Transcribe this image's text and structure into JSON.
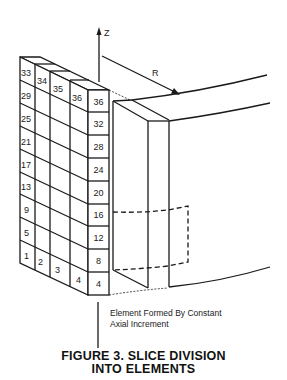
{
  "figure": {
    "caption_line1": "FIGURE 3.   SLICE DIVISION",
    "caption_line2": "INTO ELEMENTS",
    "axis_label": "Z",
    "radius_label": "R",
    "annotation_line1": "Element Formed By Constant",
    "annotation_line2": "Axial Increment"
  },
  "grid": {
    "front_column_labels": [
      "36",
      "32",
      "28",
      "24",
      "20",
      "16",
      "12",
      "8",
      "4"
    ],
    "left_column_labels": [
      "33",
      "29",
      "25",
      "21",
      "17",
      "13",
      "9",
      "5",
      "1"
    ],
    "top_row_labels": [
      "33",
      "34",
      "35",
      "36"
    ],
    "bottom_row_labels": [
      "1",
      "2",
      "3",
      "4"
    ]
  },
  "colors": {
    "ink": "#1a1a1a",
    "background": "#ffffff"
  }
}
